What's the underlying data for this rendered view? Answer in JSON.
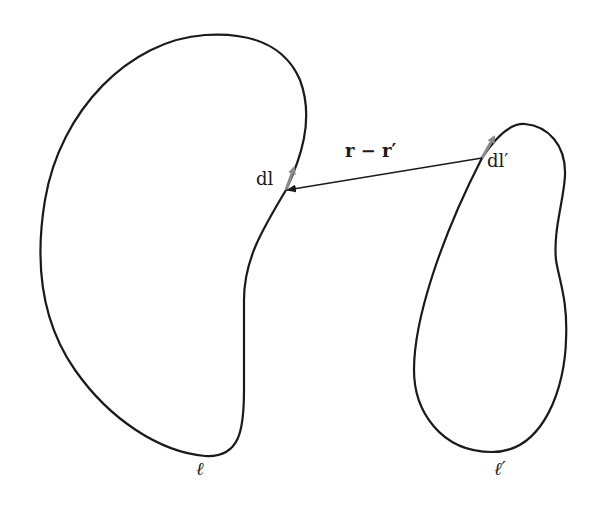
{
  "diagram": {
    "title": "",
    "loops": [
      {
        "id": "loop-l",
        "label": "ℓ"
      },
      {
        "id": "loop-l-prime",
        "label": "ℓ′"
      }
    ],
    "elements": {
      "dl": "dl",
      "dl_prime": "dl′",
      "separation": "r − r′"
    },
    "colors": {
      "curve": "#1a1a1a",
      "element_arrow": "#8a8a8a",
      "separation_arrow": "#1a1a1a"
    }
  }
}
